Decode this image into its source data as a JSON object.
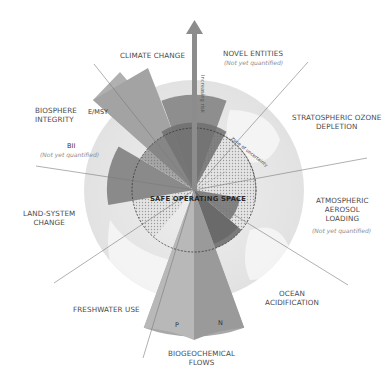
{
  "diagram": {
    "center_label": "SAFE OPERATING SPACE",
    "zone_label": "Zone of uncertainty",
    "arrow_label": "Increasing risk",
    "not_quantified": "(Not yet quantified)",
    "colors": {
      "globe": "#e9e9e9",
      "safe_hatch": "#d6d6d6",
      "boundary_dark": "#6b6b6b",
      "high_risk": "#9a9a9a",
      "very_high": "#b8b8b8",
      "line": "#7a7a7a",
      "text": "#4a4a4a"
    },
    "boundaries": [
      {
        "id": "climate-change",
        "label": "CLIMATE CHANGE"
      },
      {
        "id": "novel-entities",
        "label": "NOVEL ENTITIES",
        "sub": "(Not yet quantified)"
      },
      {
        "id": "stratospheric-ozone",
        "label": "STRATOSPHERIC OZONE",
        "label2": "DEPLETION"
      },
      {
        "id": "atmospheric-aerosol",
        "label": "ATMOSPHERIC",
        "label2": "AEROSOL",
        "label3": "LOADING",
        "sub": "(Not yet quantified)"
      },
      {
        "id": "ocean-acidification",
        "label": "OCEAN",
        "label2": "ACIDIFICATION"
      },
      {
        "id": "biogeochemical-flows",
        "label": "BIOGEOCHEMICAL",
        "label2": "FLOWS",
        "parts": [
          "P",
          "N"
        ]
      },
      {
        "id": "freshwater-use",
        "label": "FRESHWATER USE"
      },
      {
        "id": "land-system-change",
        "label": "LAND-SYSTEM",
        "label2": "CHANGE"
      },
      {
        "id": "biosphere-integrity",
        "label": "BIOSPHERE",
        "label2": "INTEGRITY",
        "parts": [
          "E/MSY",
          "BII"
        ],
        "bii_sub": "(Not yet quantified)"
      }
    ]
  }
}
